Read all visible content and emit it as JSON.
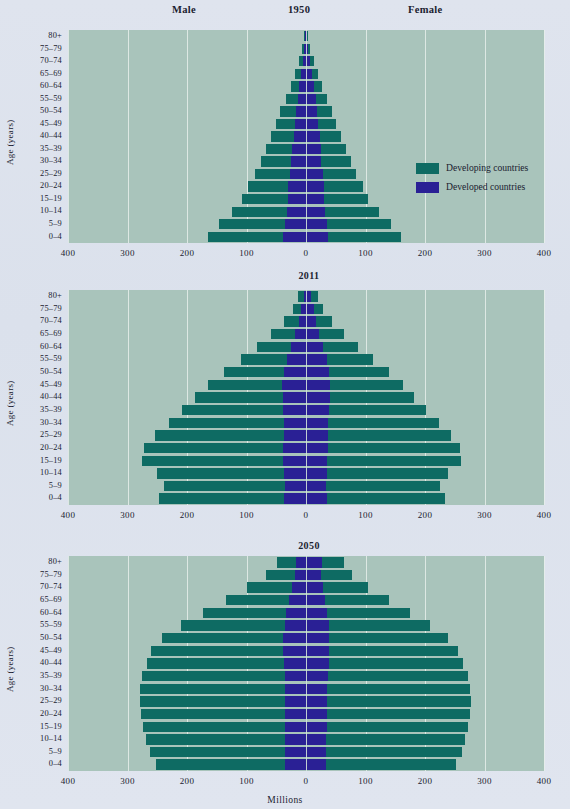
{
  "figure": {
    "male_label": "Male",
    "female_label": "Female",
    "x_axis_title": "Millions",
    "y_axis_title": "Age (years)",
    "background_color": "#dde3ee",
    "plot_background_color": "#a9c4bb",
    "gridline_color": "#e6eeea"
  },
  "legend": {
    "position": "right-inside-panel-1950",
    "items": [
      {
        "label": "Developing countries",
        "color": "#0e6b63",
        "key": "developing"
      },
      {
        "label": "Developed countries",
        "color": "#2a2095",
        "key": "developed"
      }
    ]
  },
  "axis": {
    "tick_labels": [
      "400",
      "300",
      "200",
      "100",
      "0",
      "100",
      "200",
      "300",
      "400"
    ],
    "tick_values": [
      -400,
      -300,
      -200,
      -100,
      0,
      100,
      200,
      300,
      400
    ],
    "xlim": [
      -400,
      400
    ]
  },
  "age_groups": [
    "80+",
    "75-79",
    "70-74",
    "65-69",
    "60-64",
    "55-59",
    "50-54",
    "45-49",
    "40-44",
    "35-39",
    "30-34",
    "25-29",
    "20-24",
    "15-19",
    "10-14",
    "5-9",
    "0-4"
  ],
  "panels": [
    {
      "year": "1950",
      "index": 0
    },
    {
      "year": "2011",
      "index": 1
    },
    {
      "year": "2050",
      "index": 2
    }
  ],
  "chart_data": {
    "type": "bar",
    "subtype": "population-pyramid",
    "xlabel": "Millions",
    "ylabel": "Age (years)",
    "xlim": [
      -400,
      400
    ],
    "xticks": [
      -400,
      -300,
      -200,
      -100,
      0,
      100,
      200,
      300,
      400
    ],
    "xticklabels": [
      "400",
      "300",
      "200",
      "100",
      "0",
      "100",
      "200",
      "300",
      "400"
    ],
    "grid": true,
    "legend": [
      "Developing countries",
      "Developed countries"
    ],
    "legend_position": "right inside 1950 panel",
    "categories": [
      "80+",
      "75-79",
      "70-74",
      "65-69",
      "60-64",
      "55-59",
      "50-54",
      "45-49",
      "40-44",
      "35-39",
      "30-34",
      "25-29",
      "20-24",
      "15-19",
      "10-14",
      "5-9",
      "0-4"
    ],
    "note": "Values are millions of people. Male values drawn to the left of zero, female to the right. Each bar is stacked from the centre: developed countries nearest the axis, developing countries outward. Panel values list the TOTAL bar extent from zero.",
    "panels": [
      {
        "year": "1950",
        "male": {
          "developed": [
            1,
            3,
            5,
            8,
            11,
            14,
            17,
            19,
            21,
            23,
            25,
            27,
            30,
            30,
            32,
            36,
            38
          ],
          "developing": [
            2,
            3,
            6,
            10,
            15,
            20,
            26,
            32,
            38,
            44,
            51,
            58,
            67,
            77,
            93,
            111,
            126
          ],
          "total": [
            3,
            6,
            11,
            18,
            26,
            34,
            43,
            51,
            59,
            67,
            76,
            85,
            97,
            107,
            125,
            147,
            164
          ]
        },
        "female": {
          "developed": [
            2,
            4,
            7,
            10,
            13,
            16,
            19,
            21,
            23,
            25,
            26,
            28,
            30,
            30,
            32,
            35,
            37
          ],
          "developing": [
            2,
            3,
            6,
            10,
            14,
            19,
            24,
            30,
            36,
            42,
            49,
            56,
            65,
            74,
            90,
            108,
            122
          ],
          "total": [
            4,
            7,
            13,
            20,
            27,
            35,
            43,
            51,
            59,
            67,
            75,
            84,
            95,
            104,
            122,
            143,
            159
          ]
        }
      },
      {
        "year": "2011",
        "male": {
          "developed": [
            4,
            8,
            12,
            18,
            25,
            32,
            37,
            40,
            39,
            38,
            37,
            37,
            38,
            38,
            37,
            36,
            37
          ],
          "developing": [
            9,
            14,
            25,
            40,
            58,
            77,
            101,
            125,
            147,
            170,
            193,
            216,
            234,
            237,
            214,
            203,
            210
          ],
          "total": [
            13,
            22,
            37,
            58,
            83,
            109,
            138,
            165,
            186,
            208,
            230,
            253,
            272,
            275,
            251,
            239,
            247
          ]
        },
        "female": {
          "developed": [
            9,
            13,
            17,
            22,
            28,
            35,
            39,
            41,
            40,
            38,
            37,
            37,
            37,
            36,
            35,
            34,
            35
          ],
          "developing": [
            11,
            16,
            27,
            42,
            59,
            78,
            100,
            122,
            142,
            164,
            186,
            206,
            222,
            224,
            203,
            192,
            199
          ],
          "total": [
            20,
            29,
            44,
            64,
            87,
            113,
            139,
            163,
            182,
            202,
            223,
            243,
            259,
            260,
            238,
            226,
            234
          ]
        }
      },
      {
        "year": "2050",
        "male": {
          "developed": [
            16,
            19,
            24,
            29,
            33,
            36,
            38,
            38,
            37,
            36,
            36,
            36,
            36,
            36,
            36,
            36,
            35
          ],
          "developing": [
            33,
            49,
            75,
            106,
            140,
            174,
            204,
            222,
            231,
            239,
            243,
            243,
            241,
            238,
            233,
            226,
            217
          ],
          "total": [
            49,
            68,
            99,
            135,
            173,
            210,
            242,
            260,
            268,
            275,
            279,
            279,
            277,
            274,
            269,
            262,
            252
          ]
        },
        "female": {
          "developed": [
            27,
            25,
            28,
            32,
            35,
            38,
            39,
            39,
            38,
            37,
            36,
            36,
            36,
            35,
            34,
            34,
            33
          ],
          "developing": [
            37,
            52,
            77,
            107,
            139,
            171,
            199,
            216,
            226,
            235,
            240,
            241,
            240,
            238,
            234,
            228,
            219
          ],
          "total": [
            64,
            77,
            105,
            139,
            174,
            209,
            238,
            255,
            264,
            272,
            276,
            277,
            276,
            273,
            268,
            262,
            252
          ]
        }
      }
    ]
  }
}
